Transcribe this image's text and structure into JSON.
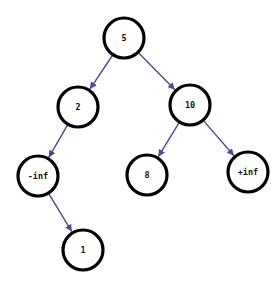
{
  "diagram": {
    "type": "binary-tree",
    "colors": {
      "background": "#ffffff",
      "node_stroke": "#000000",
      "node_fill": "#ffffff",
      "edge": "#4a4a8c",
      "label": "#111111"
    },
    "node_radius": 20,
    "nodes": [
      {
        "id": "n5",
        "label": "5",
        "x": 124,
        "y": 38
      },
      {
        "id": "n2",
        "label": "2",
        "x": 78,
        "y": 107
      },
      {
        "id": "n10",
        "label": "10",
        "x": 190,
        "y": 105
      },
      {
        "id": "nneginf",
        "label": "-inf",
        "x": 38,
        "y": 176
      },
      {
        "id": "n8",
        "label": "8",
        "x": 147,
        "y": 175
      },
      {
        "id": "nposinf",
        "label": "+inf",
        "x": 248,
        "y": 172
      },
      {
        "id": "n1",
        "label": "1",
        "x": 83,
        "y": 250
      }
    ],
    "edges": [
      {
        "from": "n5",
        "to": "n2"
      },
      {
        "from": "n5",
        "to": "n10"
      },
      {
        "from": "n2",
        "to": "nneginf"
      },
      {
        "from": "n10",
        "to": "n8"
      },
      {
        "from": "n10",
        "to": "nposinf"
      },
      {
        "from": "nneginf",
        "to": "n1"
      }
    ]
  }
}
